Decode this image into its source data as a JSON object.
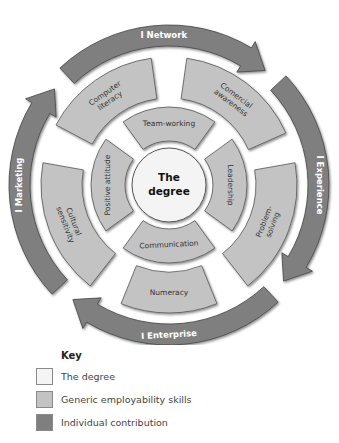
{
  "colors": {
    "degree": "#f4f4f4",
    "generic": "#c3c3c3",
    "individual": "#7f7f7f",
    "outline": "#555555",
    "text_dark": "#333333",
    "text_light": "#ffffff"
  },
  "center": {
    "line1": "The",
    "line2": "degree"
  },
  "inner_ring": [
    {
      "label": "Team-working",
      "position": "top"
    },
    {
      "label": "Leadership",
      "position": "right"
    },
    {
      "label": "Communication",
      "position": "bottom"
    },
    {
      "label": "Positive attitude",
      "position": "left"
    }
  ],
  "middle_ring": [
    {
      "label_lines": [
        "Computer",
        "literacy"
      ],
      "position": "upper-left"
    },
    {
      "label_lines": [
        "Comercial",
        "awareness"
      ],
      "position": "upper-right"
    },
    {
      "label_lines": [
        "Problem-",
        "solving"
      ],
      "position": "right"
    },
    {
      "label_lines": [
        "Numeracy"
      ],
      "position": "bottom"
    },
    {
      "label_lines": [
        "Cultural",
        "sensitivity"
      ],
      "position": "left"
    }
  ],
  "outer_arrows": [
    {
      "label": "I Network",
      "position": "top"
    },
    {
      "label": "I Experience",
      "position": "right"
    },
    {
      "label": "I Enterprise",
      "position": "bottom"
    },
    {
      "label": "I Marketing",
      "position": "left"
    }
  ],
  "key": {
    "title": "Key",
    "items": [
      {
        "label": "The degree",
        "color": "#f4f4f4"
      },
      {
        "label": "Generic employability skills",
        "color": "#c3c3c3"
      },
      {
        "label": "Individual contribution",
        "color": "#7f7f7f"
      }
    ]
  }
}
